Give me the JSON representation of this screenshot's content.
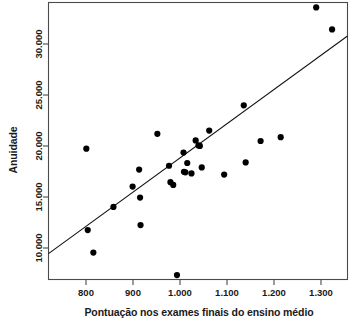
{
  "chart_data": {
    "type": "scatter",
    "title": "",
    "xlabel": "Pontuação nos exames finais do ensino médio",
    "ylabel": "Anuidade",
    "xlim": [
      745,
      1385
    ],
    "ylim": [
      7600,
      32800
    ],
    "grid": false,
    "legend": null,
    "xticks": [
      800,
      900,
      1000,
      1100,
      1200,
      1300
    ],
    "xtick_labels": [
      "800",
      "900",
      "1.000",
      "1.100",
      "1.200",
      "1.300"
    ],
    "yticks": [
      10000,
      15000,
      20000,
      25000,
      30000
    ],
    "ytick_labels": [
      "10.000",
      "15.000",
      "20.000",
      "25.000",
      "30.000"
    ],
    "point_color": "#000000",
    "line_color": "#111111",
    "frame_color": "#4a4a4a",
    "series": [
      {
        "name": "Instituições",
        "points": [
          [
            826,
            19500
          ],
          [
            829,
            12100
          ],
          [
            841,
            10050
          ],
          [
            884,
            14200
          ],
          [
            925,
            16050
          ],
          [
            939,
            17600
          ],
          [
            941,
            15050
          ],
          [
            942,
            12550
          ],
          [
            978,
            20850
          ],
          [
            1003,
            17950
          ],
          [
            1006,
            16450
          ],
          [
            1012,
            16200
          ],
          [
            1020,
            8000
          ],
          [
            1034,
            19150
          ],
          [
            1035,
            17400
          ],
          [
            1038,
            17350
          ],
          [
            1042,
            18200
          ],
          [
            1051,
            17250
          ],
          [
            1060,
            20250
          ],
          [
            1066,
            19800
          ],
          [
            1069,
            19750
          ],
          [
            1073,
            17800
          ],
          [
            1089,
            21150
          ],
          [
            1121,
            17150
          ],
          [
            1163,
            23450
          ],
          [
            1167,
            18250
          ],
          [
            1199,
            20200
          ],
          [
            1242,
            20550
          ],
          [
            1318,
            32350
          ],
          [
            1352,
            30350
          ]
        ]
      }
    ],
    "trendline": {
      "name": "Reta de regressão",
      "x_start": 745,
      "y_start": 9950,
      "x_end": 1385,
      "y_end": 29750
    }
  },
  "axis": {
    "x_label": "Pontuação nos exames finais do ensino médio",
    "y_label": "Anuidade"
  }
}
